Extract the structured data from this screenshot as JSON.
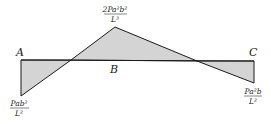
{
  "diagram": {
    "type": "bending-moment-diagram",
    "fill_color": "#d4d4d4",
    "stroke_color": "#1a1a1a",
    "points": {
      "A": "A",
      "B": "B",
      "C": "C"
    },
    "labels": {
      "peak": {
        "numerator": "2Pa²b²",
        "denominator": "L³"
      },
      "left_end": {
        "numerator": "Pab²",
        "denominator": "L²"
      },
      "right_end": {
        "numerator": "Pa²b",
        "denominator": "L²"
      }
    }
  }
}
